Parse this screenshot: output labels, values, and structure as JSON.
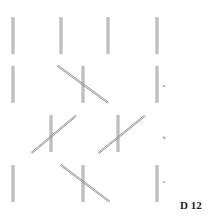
{
  "figure": {
    "plate_label": "D 12",
    "row_labels": [
      "a",
      "b",
      "c"
    ],
    "rows": [
      {
        "name": "reference",
        "items": [
          "vertical",
          "vertical",
          "vertical",
          "vertical"
        ]
      },
      {
        "name": "a",
        "items": [
          "vertical",
          "cross-falling",
          "vertical"
        ]
      },
      {
        "name": "b",
        "items": [
          "cross-rising",
          "cross-rising"
        ]
      },
      {
        "name": "c",
        "items": [
          "vertical",
          "cross-falling",
          "vertical"
        ]
      }
    ],
    "colors": {
      "line": "#8a8a8a",
      "line_dark": "#6e6e6e",
      "background": "#ffffff"
    }
  }
}
